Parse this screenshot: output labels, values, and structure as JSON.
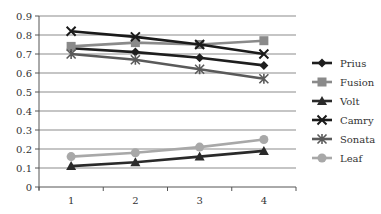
{
  "chart_data": {
    "type": "line",
    "title": "",
    "xlabel": "",
    "ylabel": "",
    "x": [
      1,
      2,
      3,
      4
    ],
    "categories": [
      "1",
      "2",
      "3",
      "4"
    ],
    "ylim": [
      0,
      0.9
    ],
    "yticks": [
      "0",
      "0.1",
      "0.2",
      "0.3",
      "0.4",
      "0.5",
      "0.6",
      "0.7",
      "0.8",
      "0.9"
    ],
    "grid": true,
    "legend_position": "right",
    "series": [
      {
        "name": "Prius",
        "values": [
          0.73,
          0.71,
          0.68,
          0.64
        ],
        "color": "#1e1e1e",
        "marker": "diamond"
      },
      {
        "name": "Fusion",
        "values": [
          0.74,
          0.76,
          0.75,
          0.77
        ],
        "color": "#8a8a8a",
        "marker": "square"
      },
      {
        "name": "Volt",
        "values": [
          0.11,
          0.13,
          0.16,
          0.19
        ],
        "color": "#2a2a2a",
        "marker": "triangle"
      },
      {
        "name": "Camry",
        "values": [
          0.82,
          0.79,
          0.75,
          0.7
        ],
        "color": "#1a1a1a",
        "marker": "x"
      },
      {
        "name": "Sonata",
        "values": [
          0.7,
          0.67,
          0.62,
          0.57
        ],
        "color": "#5a5a5a",
        "marker": "asterisk"
      },
      {
        "name": "Leaf",
        "values": [
          0.16,
          0.18,
          0.21,
          0.25
        ],
        "color": "#a8a8a8",
        "marker": "circle"
      }
    ]
  }
}
